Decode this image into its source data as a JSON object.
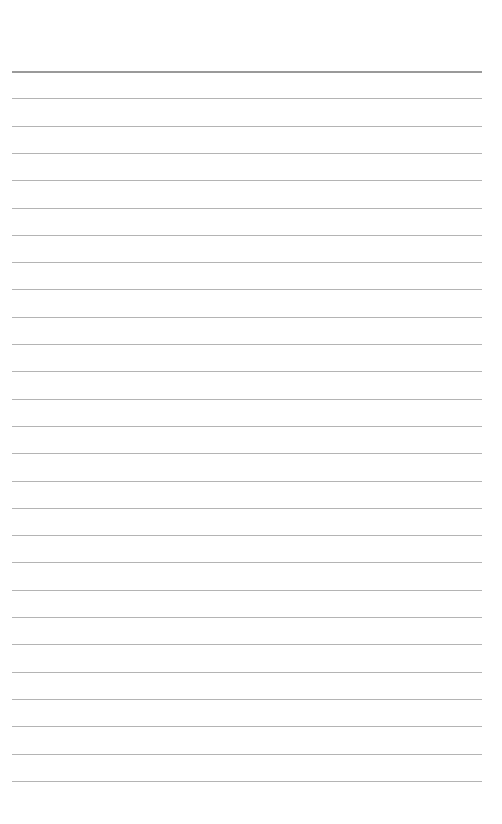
{
  "page": {
    "type": "lined-paper",
    "background_color": "#ffffff",
    "line_color": "#b4b4b4",
    "header_line_color": "#9a9a9a",
    "first_line_y": 71,
    "line_spacing": 27.3,
    "line_count": 27,
    "line_left": 12,
    "line_width": 470
  }
}
